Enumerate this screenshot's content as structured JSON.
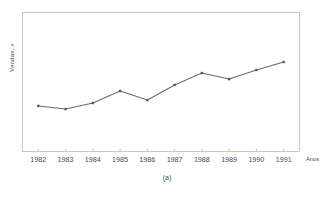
{
  "chart_data": {
    "type": "line",
    "title": "",
    "subtitle": "",
    "xlabel": "Anos",
    "ylabel": "Vendas, x",
    "ylabel_parts": {
      "main": "Vendas, ",
      "italic": "x"
    },
    "caption": "(a)",
    "categories": [
      "1982",
      "1983",
      "1984",
      "1985",
      "1986",
      "1987",
      "1988",
      "1989",
      "1990",
      "1991"
    ],
    "x": [
      1982,
      1983,
      1984,
      1985,
      1986,
      1987,
      1988,
      1989,
      1990,
      1991
    ],
    "values": [
      32.9,
      30.7,
      35.0,
      43.6,
      37.1,
      47.9,
      56.4,
      52.1,
      58.6,
      64.3
    ],
    "series": [
      {
        "name": "Vendas",
        "values": [
          32.9,
          30.7,
          35.0,
          43.6,
          37.1,
          47.9,
          56.4,
          52.1,
          58.6,
          64.3
        ]
      }
    ],
    "ylim": [
      0,
      100
    ],
    "xlim": [
      1981.4,
      1991.6
    ],
    "y_tick_labels": [],
    "x_tick_labels": [
      "1982",
      "1983",
      "1984",
      "1985",
      "1986",
      "1987",
      "1988",
      "1989",
      "1990",
      "1991"
    ],
    "grid": false,
    "legend": false,
    "legend_position": "none",
    "marker": "square",
    "line_color": "#6b6b6b",
    "marker_color": "#5a5a5a",
    "frame_color": "#c8c8c8",
    "text_color": "#4a4a4a",
    "background_color": "#ffffff"
  }
}
